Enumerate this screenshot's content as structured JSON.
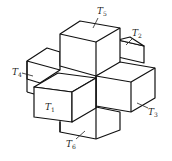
{
  "diagram": {
    "labels": [
      {
        "id": "T1",
        "main": "T",
        "sub": "1",
        "position": "front"
      },
      {
        "id": "T2",
        "main": "T",
        "sub": "2",
        "position": "back-right"
      },
      {
        "id": "T3",
        "main": "T",
        "sub": "3",
        "position": "right"
      },
      {
        "id": "T4",
        "main": "T",
        "sub": "4",
        "position": "left"
      },
      {
        "id": "T5",
        "main": "T",
        "sub": "5",
        "position": "top"
      },
      {
        "id": "T6",
        "main": "T",
        "sub": "6",
        "position": "bottom"
      }
    ],
    "colors": {
      "stroke": "#111111",
      "background": "#ffffff"
    }
  }
}
